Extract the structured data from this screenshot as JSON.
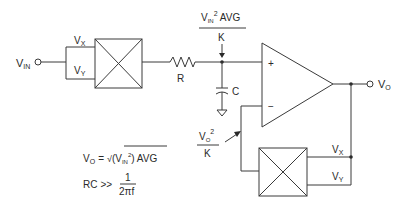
{
  "diagram": {
    "input": {
      "label_main": "V",
      "label_sub": "IN"
    },
    "input_multiplier": {
      "x_input": {
        "main": "V",
        "sub": "X"
      },
      "y_input": {
        "main": "V",
        "sub": "Y"
      }
    },
    "resistor": {
      "label": "R"
    },
    "capacitor": {
      "label": "C"
    },
    "node_annotation": {
      "num_main": "V",
      "num_sub": "IN",
      "num_sup": "2",
      "num_suffix": " AVG",
      "den": "K"
    },
    "opamp": {
      "plus": "+",
      "minus": "−"
    },
    "output": {
      "label_main": "V",
      "label_sub": "O"
    },
    "feedback_annotation": {
      "num_main": "V",
      "num_sub": "O",
      "num_sup": "2",
      "den": "K"
    },
    "feedback_multiplier": {
      "x_input": {
        "main": "V",
        "sub": "X"
      },
      "y_input": {
        "main": "V",
        "sub": "Y"
      }
    },
    "equations": {
      "eq1": {
        "lhs_main": "V",
        "lhs_sub": "O",
        "equals": "=",
        "root": "√",
        "inner_open": "(",
        "inner_main": "V",
        "inner_sub": "IN",
        "inner_sup": "2",
        "inner_close": ")",
        "suffix": " AVG"
      },
      "eq2": {
        "lhs": "RC",
        "op": ">>",
        "num": "1",
        "den": "2πf"
      }
    }
  }
}
